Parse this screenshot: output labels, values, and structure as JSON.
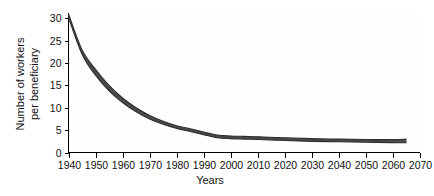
{
  "chart_data": {
    "type": "area",
    "title": "",
    "subtitle": "",
    "xlabel": "Years",
    "ylabel": "Number of workers per beneficiary",
    "ylabel_line1": "Number of workers",
    "ylabel_line2": "per beneficiary",
    "xlim": [
      1940,
      2070
    ],
    "ylim": [
      0,
      31
    ],
    "grid": false,
    "legend": null,
    "legend_position": "none",
    "xticks": [
      1940,
      1950,
      1960,
      1970,
      1980,
      1990,
      2000,
      2010,
      2020,
      2030,
      2040,
      2050,
      2060,
      2070
    ],
    "xtick_labels": [
      "1940",
      "1950",
      "1960",
      "1970",
      "1980",
      "1990",
      "2000",
      "2010",
      "2020",
      "2030",
      "2040",
      "2050",
      "2060",
      "2070"
    ],
    "yticks": [
      0,
      5,
      10,
      15,
      20,
      25,
      30
    ],
    "ytick_labels": [
      "0",
      "5",
      "10",
      "15",
      "20",
      "25",
      "30"
    ],
    "series_color": "#4a4a4a",
    "axis_color": "#000000",
    "background_color": "#ffffff",
    "band_note": "thick shaded band representing range of workers per beneficiary",
    "x": [
      1940,
      1945,
      1950,
      1955,
      1960,
      1965,
      1970,
      1975,
      1980,
      1985,
      1990,
      1995,
      2000,
      2005,
      2010,
      2020,
      2030,
      2040,
      2050,
      2060,
      2065
    ],
    "series": [
      {
        "name": "upper bound",
        "values": [
          31.0,
          23.0,
          18.6,
          15.0,
          12.2,
          10.0,
          8.3,
          7.0,
          6.0,
          5.3,
          4.6,
          3.9,
          3.7,
          3.6,
          3.5,
          3.3,
          3.1,
          3.0,
          2.9,
          2.9,
          3.0
        ]
      },
      {
        "name": "lower bound",
        "values": [
          30.2,
          22.0,
          17.3,
          13.8,
          11.2,
          9.1,
          7.5,
          6.3,
          5.4,
          4.7,
          4.0,
          3.3,
          3.1,
          3.0,
          2.9,
          2.7,
          2.5,
          2.4,
          2.3,
          2.2,
          2.2
        ]
      }
    ]
  },
  "axes": {
    "x_title": "Years",
    "y_title_line1": "Number of workers",
    "y_title_line2": "per beneficiary"
  }
}
